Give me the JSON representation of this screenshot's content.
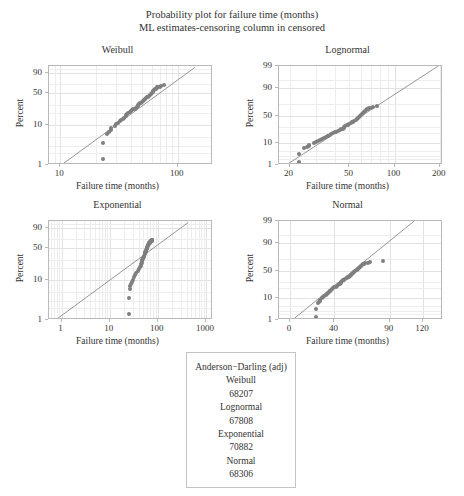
{
  "figure": {
    "title_line1": "Probability plot for failure time (months)",
    "title_line2": "ML estimates-censoring column in censored",
    "point_color": "#7f7f7f",
    "line_color": "#8a8a8a",
    "frame_color": "#b9b9b9",
    "grid_color": "#ededed"
  },
  "chart_data": [
    {
      "type": "scatter",
      "title": "Weibull",
      "xlabel": "Failure time (months)",
      "ylabel": "Percent",
      "xscale": "log",
      "yscale": "weibull-probability",
      "grid": true,
      "xticks": [
        10,
        100
      ],
      "xtick_labels": [
        "10",
        "100"
      ],
      "yticks": [
        1,
        10,
        50,
        90
      ],
      "ytick_labels": [
        "1",
        "10",
        "50",
        "90"
      ],
      "xlim": [
        8,
        200
      ],
      "ylim": [
        1,
        97
      ],
      "points_x": [
        23,
        23,
        25,
        26,
        27,
        27,
        29,
        30,
        31,
        32,
        33,
        34,
        35,
        36,
        36,
        37,
        38,
        39,
        40,
        41,
        42,
        43,
        44,
        45,
        46,
        46,
        47,
        48,
        49,
        50,
        51,
        52,
        53,
        54,
        55,
        56,
        57,
        58,
        59,
        60,
        61,
        62,
        63,
        64,
        65,
        66,
        67,
        68,
        70,
        72,
        76
      ],
      "points_y": [
        1.4,
        3.6,
        6.2,
        7.0,
        7.8,
        8.6,
        9.6,
        10.5,
        11.4,
        12.4,
        13.3,
        14.3,
        15.3,
        16.3,
        17.2,
        18.2,
        19.2,
        20.3,
        21.3,
        22.4,
        23.5,
        24.6,
        25.8,
        27.0,
        28.2,
        29.4,
        30.7,
        32.0,
        33.3,
        34.6,
        36.0,
        37.4,
        38.9,
        40.4,
        42.0,
        43.6,
        45.3,
        47.0,
        48.8,
        50.7,
        52.6,
        54.6,
        56.7,
        58.3,
        60.0,
        61.5,
        62.6,
        63.5,
        64.5,
        65.5,
        67.5
      ],
      "fit_line": {
        "x1": 10.2,
        "y1": 1.0,
        "x2": 140,
        "y2": 96
      }
    },
    {
      "type": "scatter",
      "title": "Lognormal",
      "xlabel": "Failure time (months)",
      "ylabel": "Percent",
      "xscale": "log",
      "yscale": "normal-probability",
      "grid": true,
      "xticks": [
        20,
        50,
        100,
        200
      ],
      "xtick_labels": [
        "20",
        "50",
        "100",
        "200"
      ],
      "yticks": [
        1,
        10,
        50,
        90,
        99
      ],
      "ytick_labels": [
        "1",
        "10",
        "50",
        "90",
        "99"
      ],
      "xlim": [
        17,
        210
      ],
      "ylim": [
        1,
        99
      ],
      "points_x": [
        23,
        23,
        25,
        26,
        27,
        27,
        29,
        30,
        31,
        32,
        33,
        34,
        35,
        36,
        36,
        37,
        38,
        39,
        40,
        41,
        42,
        43,
        44,
        45,
        46,
        46,
        47,
        48,
        49,
        50,
        51,
        52,
        53,
        54,
        55,
        56,
        57,
        58,
        59,
        60,
        61,
        62,
        63,
        64,
        65,
        66,
        67,
        68,
        70,
        72,
        76
      ],
      "points_y": [
        1.4,
        3.6,
        6.2,
        7.0,
        7.8,
        8.6,
        9.6,
        10.5,
        11.4,
        12.4,
        13.3,
        14.3,
        15.3,
        16.3,
        17.2,
        18.2,
        19.2,
        20.3,
        21.3,
        22.4,
        23.5,
        24.6,
        25.8,
        27.0,
        28.2,
        29.4,
        30.7,
        32.0,
        33.3,
        34.6,
        36.0,
        37.4,
        38.9,
        40.4,
        42.0,
        43.6,
        45.3,
        47.0,
        48.8,
        50.7,
        52.6,
        54.6,
        56.7,
        58.3,
        60.0,
        61.5,
        62.6,
        63.5,
        64.5,
        65.5,
        67.5
      ],
      "fit_line": {
        "x1": 19,
        "y1": 1.0,
        "x2": 195,
        "y2": 99
      }
    },
    {
      "type": "scatter",
      "title": "Exponential",
      "xlabel": "Failure time (months)",
      "ylabel": "Percent",
      "xscale": "log",
      "yscale": "exponential-probability",
      "grid": true,
      "xticks": [
        1,
        10,
        100,
        1000
      ],
      "xtick_labels": [
        "1",
        "10",
        "100",
        "1000"
      ],
      "yticks": [
        1,
        10,
        50,
        90
      ],
      "ytick_labels": [
        "1",
        "10",
        "50",
        "90"
      ],
      "xlim": [
        0.55,
        1400
      ],
      "ylim": [
        1,
        97
      ],
      "points_x": [
        25,
        25,
        26,
        27,
        28,
        29,
        30,
        32,
        34,
        36,
        38,
        40,
        42,
        44,
        45,
        46,
        47,
        48,
        49,
        50,
        51,
        52,
        53,
        54,
        55,
        56,
        57,
        58,
        59,
        60,
        61,
        62,
        63,
        64,
        65,
        66,
        67,
        68,
        69,
        70,
        70,
        71,
        71,
        72,
        72,
        73,
        73,
        74,
        74,
        75,
        76
      ],
      "points_y": [
        1.4,
        3.6,
        6.2,
        7.2,
        8.2,
        9.3,
        10.4,
        12.0,
        13.6,
        15.2,
        16.8,
        18.5,
        20.3,
        22.2,
        24.0,
        25.8,
        27.6,
        29.4,
        31.2,
        33.0,
        34.8,
        36.6,
        38.4,
        40.2,
        42.0,
        43.8,
        45.6,
        47.4,
        49.2,
        51.0,
        52.8,
        54.6,
        56.4,
        58.0,
        59.4,
        60.6,
        61.6,
        62.4,
        63.2,
        63.8,
        64.4,
        64.9,
        65.3,
        65.7,
        66.0,
        66.3,
        66.6,
        66.9,
        67.1,
        67.3,
        67.5
      ],
      "fit_line": {
        "x1": 0.75,
        "y1": 1.0,
        "x2": 430,
        "y2": 96
      }
    },
    {
      "type": "scatter",
      "title": "Normal",
      "xlabel": "Failure time (months)",
      "ylabel": "Percent",
      "xscale": "linear",
      "yscale": "normal-probability",
      "grid": true,
      "xticks": [
        0,
        40,
        90,
        120
      ],
      "xtick_labels": [
        "0",
        "40",
        "90",
        "120"
      ],
      "yticks": [
        1,
        10,
        50,
        90,
        99
      ],
      "ytick_labels": [
        "1",
        "10",
        "50",
        "90",
        "99"
      ],
      "xlim": [
        -10,
        138
      ],
      "ylim": [
        1,
        99
      ],
      "points_x": [
        23,
        23,
        25,
        26,
        27,
        27,
        29,
        30,
        31,
        32,
        33,
        34,
        35,
        36,
        36,
        37,
        38,
        39,
        40,
        41,
        42,
        43,
        44,
        45,
        46,
        46,
        47,
        48,
        49,
        50,
        51,
        52,
        53,
        54,
        55,
        56,
        57,
        58,
        59,
        60,
        61,
        62,
        63,
        64,
        65,
        66,
        67,
        68,
        70,
        72,
        84
      ],
      "points_y": [
        1.4,
        3.6,
        6.2,
        7.0,
        7.8,
        8.6,
        9.6,
        10.5,
        11.4,
        12.4,
        13.3,
        14.3,
        15.3,
        16.3,
        17.2,
        18.2,
        19.2,
        20.3,
        21.3,
        22.4,
        23.5,
        24.6,
        25.8,
        27.0,
        28.2,
        29.4,
        30.7,
        32.0,
        33.3,
        34.6,
        36.0,
        37.4,
        38.9,
        40.4,
        42.0,
        43.6,
        45.3,
        47.0,
        48.8,
        50.7,
        52.6,
        54.6,
        56.7,
        58.3,
        60.0,
        61.5,
        62.6,
        63.5,
        64.5,
        65.5,
        67.5
      ],
      "fit_line": {
        "x1": 2,
        "y1": 1.0,
        "x2": 112,
        "y2": 99
      }
    }
  ],
  "anderson_darling": {
    "header": "Anderson−Darling (adj)",
    "entries": [
      {
        "name": "Weibull",
        "value": "68207"
      },
      {
        "name": "Lognormal",
        "value": "67808"
      },
      {
        "name": "Exponential",
        "value": "70882"
      },
      {
        "name": "Normal",
        "value": "68306"
      }
    ]
  }
}
